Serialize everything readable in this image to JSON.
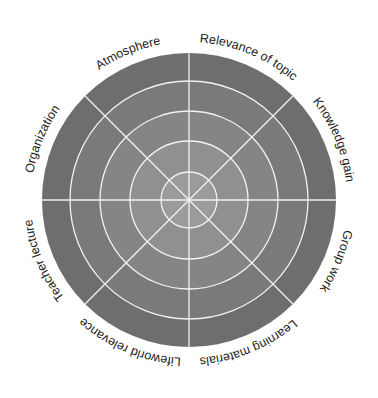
{
  "diagram": {
    "type": "evaluation-target-wheel",
    "center": [
      189,
      200
    ],
    "rings": [
      {
        "radius": 147,
        "color": "#6e6e6e"
      },
      {
        "radius": 119,
        "color": "#7a7a7a"
      },
      {
        "radius": 89,
        "color": "#858585"
      },
      {
        "radius": 59,
        "color": "#909090"
      },
      {
        "radius": 28,
        "color": "#9b9b9b"
      }
    ],
    "line_color": "#f2f2f2",
    "label_radius": 158,
    "segments": [
      {
        "label": "Relevance of topic",
        "angle": 22.5
      },
      {
        "label": "Knowledge gain",
        "angle": 67.5
      },
      {
        "label": "Group work",
        "angle": 112.5
      },
      {
        "label": "Learning materials",
        "angle": 157.5
      },
      {
        "label": "Lifeworld relevance",
        "angle": 202.5
      },
      {
        "label": "Teacher lecture",
        "angle": 247.5
      },
      {
        "label": "Organization",
        "angle": 292.5
      },
      {
        "label": "Atmosphere",
        "angle": 337.5
      }
    ]
  }
}
